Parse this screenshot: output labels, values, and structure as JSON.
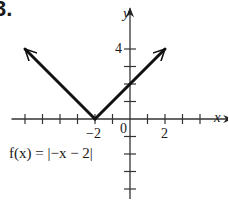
{
  "problem_number": "3.",
  "chart_data": {
    "type": "line",
    "title": "",
    "function_label": "f(x) = |−x − 2|",
    "xlabel": "x",
    "ylabel": "y",
    "x_tick_labels": [
      "−2",
      "0",
      "2"
    ],
    "y_tick_labels": [
      "4"
    ],
    "origin_label": "0",
    "xlim": [
      -7,
      5.5
    ],
    "ylim": [
      -4.5,
      6.5
    ],
    "grid": false,
    "x_ticks": [
      -6,
      -5,
      -4,
      -3,
      -2,
      -1,
      1,
      2,
      3,
      4
    ],
    "y_ticks": [
      -4,
      -3,
      -2,
      -1,
      1,
      2,
      3,
      4
    ],
    "series": [
      {
        "name": "f(x) = |−x − 2|",
        "x": [
          -6,
          -2,
          2
        ],
        "y": [
          4,
          0,
          4
        ],
        "arrows_at_ends": true
      }
    ],
    "annotations": [
      {
        "text": "vertex",
        "x": -2,
        "y": 0
      },
      {
        "text": "y-intercept",
        "x": 0,
        "y": 2
      }
    ]
  },
  "colors": {
    "line": "#111111",
    "axis": "#333333",
    "background": "#ffffff"
  }
}
